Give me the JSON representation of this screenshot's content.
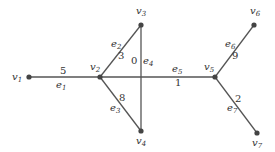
{
  "diagram": {
    "type": "weighted-graph",
    "vertices": [
      {
        "id": "v1",
        "name": "v",
        "sub": "1",
        "x": 29,
        "y": 77,
        "lx": 12,
        "ly": 80
      },
      {
        "id": "v2",
        "name": "v",
        "sub": "2",
        "x": 100,
        "y": 77,
        "lx": 90,
        "ly": 70
      },
      {
        "id": "v3",
        "name": "v",
        "sub": "3",
        "x": 141,
        "y": 25,
        "lx": 136,
        "ly": 14
      },
      {
        "id": "v4",
        "name": "v",
        "sub": "4",
        "x": 141,
        "y": 131,
        "lx": 136,
        "ly": 144
      },
      {
        "id": "v5",
        "name": "v",
        "sub": "5",
        "x": 215,
        "y": 77,
        "lx": 204,
        "ly": 70
      },
      {
        "id": "v6",
        "name": "v",
        "sub": "6",
        "x": 254,
        "y": 25,
        "lx": 250,
        "ly": 14
      },
      {
        "id": "v7",
        "name": "v",
        "sub": "7",
        "x": 257,
        "y": 133,
        "lx": 252,
        "ly": 146
      }
    ],
    "edges": [
      {
        "id": "e1",
        "name": "e",
        "sub": "1",
        "from": "v1",
        "to": "v2",
        "weight": "5",
        "lx": 56,
        "ly": 88,
        "wx": 60,
        "wy": 74
      },
      {
        "id": "e2",
        "name": "e",
        "sub": "2",
        "from": "v2",
        "to": "v3",
        "weight": "3",
        "lx": 111,
        "ly": 47,
        "wx": 118,
        "wy": 59
      },
      {
        "id": "e3",
        "name": "e",
        "sub": "3",
        "from": "v2",
        "to": "v4",
        "weight": "8",
        "lx": 110,
        "ly": 111,
        "wx": 119,
        "wy": 101
      },
      {
        "id": "e4",
        "name": "e",
        "sub": "4",
        "from": "v3",
        "to": "v4",
        "weight": "0",
        "lx": 143,
        "ly": 64,
        "wx": 131,
        "wy": 64
      },
      {
        "id": "e5",
        "name": "e",
        "sub": "5",
        "from": "v2",
        "to": "v5",
        "weight": "1",
        "lx": 172,
        "ly": 72,
        "wx": 175,
        "wy": 86
      },
      {
        "id": "e6",
        "name": "e",
        "sub": "6",
        "from": "v5",
        "to": "v6",
        "weight": "9",
        "lx": 225,
        "ly": 47,
        "wx": 232,
        "wy": 59
      },
      {
        "id": "e7",
        "name": "e",
        "sub": "7",
        "from": "v5",
        "to": "v7",
        "weight": "2",
        "lx": 227,
        "ly": 111,
        "wx": 235,
        "wy": 102
      }
    ]
  }
}
